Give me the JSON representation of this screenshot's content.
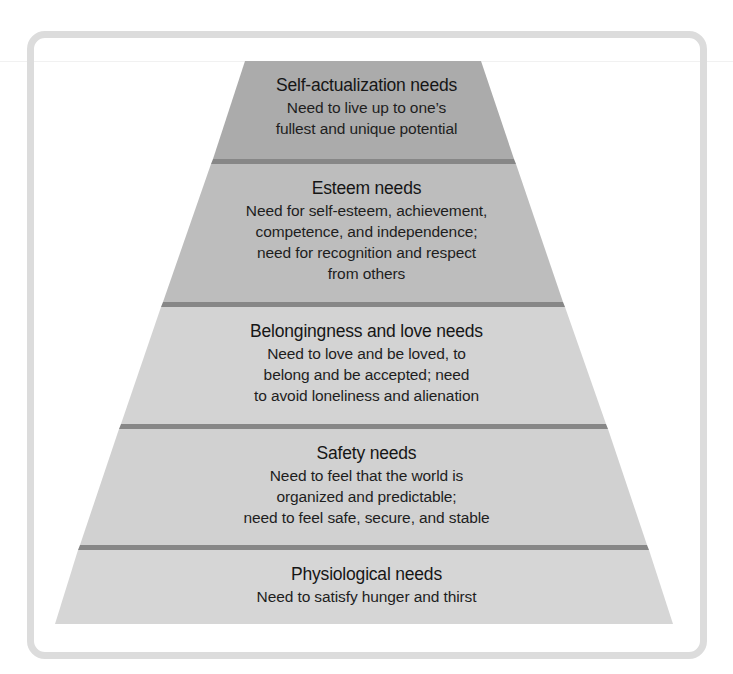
{
  "diagram": {
    "type": "pyramid",
    "tiers": [
      {
        "level": 5,
        "title": "Self-actualization needs",
        "description": "Need to live up to one’s\nfullest and unique potential",
        "fill": "#ababab"
      },
      {
        "level": 4,
        "title": "Esteem needs",
        "description": "Need for self-esteem, achievement,\ncompetence, and independence;\nneed for recognition and respect\nfrom others",
        "fill": "#bdbdbd"
      },
      {
        "level": 3,
        "title": "Belongingness and love needs",
        "description": "Need to love and be loved, to\nbelong and be accepted; need\nto avoid loneliness and alienation",
        "fill": "#d3d3d3"
      },
      {
        "level": 2,
        "title": "Safety needs",
        "description": "Need to feel that the world is\norganized and predictable;\nneed to feel safe, secure, and stable",
        "fill": "#d1d1d1"
      },
      {
        "level": 1,
        "title": "Physiological needs",
        "description": "Need to satisfy hunger and thirst",
        "fill": "#d6d6d6"
      }
    ],
    "colors": {
      "divider": "#878787",
      "frame_border": "#dcdcdc",
      "background": "#ffffff",
      "text": "#1c1c1c"
    }
  }
}
